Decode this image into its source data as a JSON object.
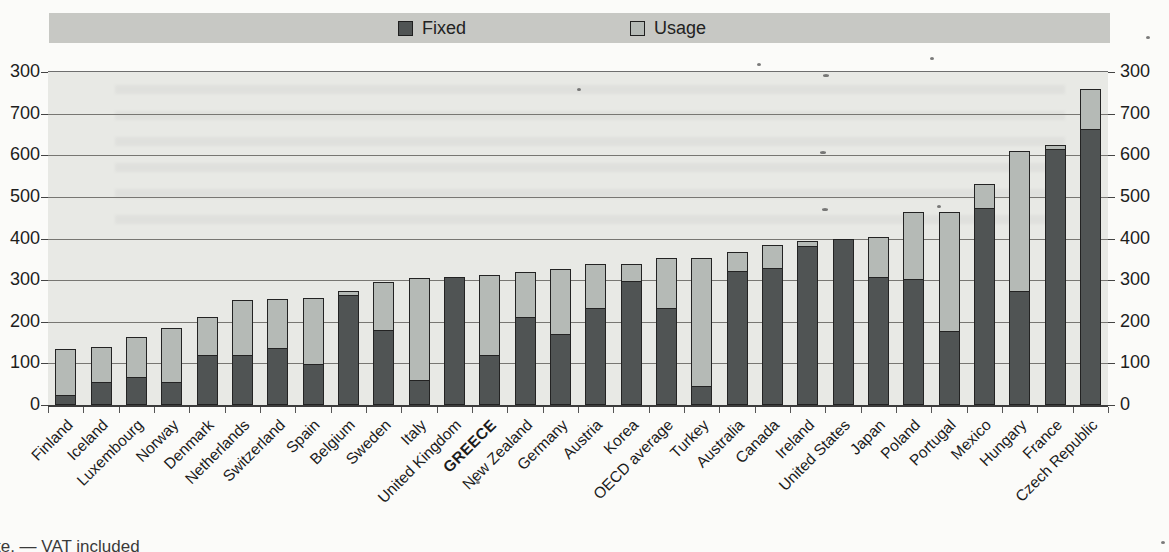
{
  "legend": {
    "items": [
      {
        "label": "Fixed",
        "color": "#505454"
      },
      {
        "label": "Usage",
        "color": "#b5bab6"
      }
    ]
  },
  "note": "te. — VAT included",
  "chart_data": {
    "type": "bar",
    "stacked": true,
    "title": "",
    "xlabel": "",
    "ylabel": "",
    "legend_position": "top",
    "grid": true,
    "ylim": [
      0,
      800
    ],
    "y_tick_values": [
      800,
      700,
      600,
      500,
      400,
      300,
      200,
      100,
      0
    ],
    "y_tick_labels_displayed": [
      "300",
      "700",
      "600",
      "500",
      "400",
      "300",
      "200",
      "100",
      "0"
    ],
    "dual_y_axis": true,
    "highlight_category": "GREECE",
    "categories": [
      "Finland",
      "Iceland",
      "Luxembourg",
      "Norway",
      "Denmark",
      "Netherlands",
      "Switzerland",
      "Spain",
      "Belgium",
      "Sweden",
      "Italy",
      "United Kingdom",
      "GREECE",
      "New Zealand",
      "Germany",
      "Austria",
      "Korea",
      "OECD average",
      "Turkey",
      "Australia",
      "Canada",
      "Ireland",
      "United States",
      "Japan",
      "Poland",
      "Portugal",
      "Mexico",
      "Hungary",
      "France",
      "Czech Republic"
    ],
    "series": [
      {
        "name": "Fixed",
        "color": "#505454",
        "values": [
          25,
          55,
          67,
          55,
          120,
          119,
          138,
          99,
          265,
          180,
          60,
          307,
          120,
          212,
          170,
          234,
          299,
          234,
          46,
          321,
          330,
          381,
          398,
          307,
          303,
          177,
          473,
          275,
          614,
          663
        ]
      },
      {
        "name": "Usage",
        "color": "#b5bab6",
        "values": [
          110,
          85,
          97,
          130,
          92,
          133,
          118,
          159,
          10,
          115,
          245,
          0,
          191,
          109,
          155,
          106,
          41,
          120,
          308,
          45,
          55,
          12,
          0,
          95,
          160,
          286,
          58,
          336,
          10,
          95
        ]
      }
    ]
  }
}
